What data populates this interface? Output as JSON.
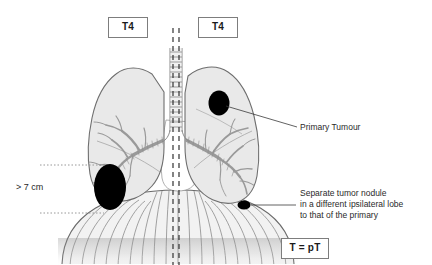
{
  "figure": {
    "background_color": "#ffffff"
  },
  "stage_labels": {
    "left_box": "T4",
    "right_box": "T4",
    "classification_box": "T = pT"
  },
  "annotations": {
    "primary_tumour": "Primary Tumour",
    "separate_nodule": "Separate tumor nodule\nin a different ipsilateral lobe\nto that of the primary",
    "size_measurement": "> 7 cm"
  },
  "anatomy": {
    "left_lung_label": "left-lung",
    "right_lung_label": "right-lung",
    "trachea_label": "trachea",
    "bronchi_label": "bronchial-tree",
    "diaphragm_label": "diaphragm",
    "midline_label": "body-midline"
  },
  "lesions": [
    {
      "name": "large-tumour",
      "description": "Large primary tumour greater than 7 cm",
      "cx": 110,
      "cy": 187,
      "rx": 16,
      "ry": 23,
      "color": "#000000"
    },
    {
      "name": "primary-tumour",
      "description": "Primary tumour in upper right lung field",
      "cx": 219,
      "cy": 103,
      "rx": 10.5,
      "ry": 12.5,
      "color": "#000000"
    },
    {
      "name": "satellite-nodule",
      "description": "Separate tumor nodule in a different ipsilateral lobe",
      "cx": 244,
      "cy": 205,
      "rx": 6.5,
      "ry": 4.5,
      "color": "#000000"
    }
  ],
  "colors": {
    "lung_fill": "#e9e9e9",
    "lung_stroke": "#6e6e6e",
    "bronchi_stroke": "#9a9a9a",
    "lesion": "#000000",
    "midline": "#333333",
    "measure_line": "#8c8c8c",
    "leader_line": "#3a3a3a",
    "box_border": "#7d7d7d",
    "text": "#2a2a2a",
    "diaphragm_stroke": "#777777"
  }
}
